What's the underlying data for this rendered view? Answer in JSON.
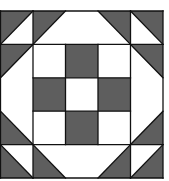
{
  "colors": {
    "dark": "#5e5e5e",
    "light": "#ffffff",
    "line": "#111111",
    "background": "#ffffff"
  },
  "block": {
    "x": 0.5,
    "y": 11,
    "width": 162.5,
    "height": 167,
    "grid": 5
  },
  "dark_squares": [
    {
      "col": 2,
      "row": 1
    },
    {
      "col": 1,
      "row": 2
    },
    {
      "col": 3,
      "row": 2
    },
    {
      "col": 2,
      "row": 3
    }
  ],
  "light_squares": [
    {
      "col": 1,
      "row": 1
    },
    {
      "col": 3,
      "row": 1
    },
    {
      "col": 2,
      "row": 2
    },
    {
      "col": 1,
      "row": 3
    },
    {
      "col": 3,
      "row": 3
    }
  ],
  "dark_triangles": [
    {
      "name": "top-left-corner",
      "pts": [
        [
          0,
          0
        ],
        [
          1,
          0
        ],
        [
          0,
          1
        ]
      ]
    },
    {
      "name": "top-left-inner",
      "pts": [
        [
          1,
          0
        ],
        [
          2,
          0
        ],
        [
          1,
          1
        ]
      ]
    },
    {
      "name": "top-right-inner",
      "pts": [
        [
          3,
          0
        ],
        [
          4,
          0
        ],
        [
          4,
          1
        ]
      ]
    },
    {
      "name": "top-right-corner",
      "pts": [
        [
          4,
          0
        ],
        [
          5,
          0
        ],
        [
          5,
          1
        ]
      ]
    },
    {
      "name": "left-upper",
      "pts": [
        [
          0,
          1
        ],
        [
          1,
          1
        ],
        [
          0,
          2
        ]
      ]
    },
    {
      "name": "right-upper",
      "pts": [
        [
          4,
          1
        ],
        [
          5,
          1
        ],
        [
          5,
          2
        ]
      ]
    },
    {
      "name": "left-lower",
      "pts": [
        [
          0,
          3
        ],
        [
          0,
          4
        ],
        [
          1,
          4
        ]
      ]
    },
    {
      "name": "right-lower",
      "pts": [
        [
          5,
          3
        ],
        [
          5,
          4
        ],
        [
          4,
          4
        ]
      ]
    },
    {
      "name": "bottom-left-corner",
      "pts": [
        [
          0,
          4
        ],
        [
          0,
          5
        ],
        [
          1,
          5
        ]
      ]
    },
    {
      "name": "bottom-left-inner",
      "pts": [
        [
          1,
          4
        ],
        [
          1,
          5
        ],
        [
          2,
          5
        ]
      ]
    },
    {
      "name": "bottom-right-inner",
      "pts": [
        [
          4,
          4
        ],
        [
          4,
          5
        ],
        [
          3,
          5
        ]
      ]
    },
    {
      "name": "bottom-right-corner",
      "pts": [
        [
          5,
          4
        ],
        [
          5,
          5
        ],
        [
          4,
          5
        ]
      ]
    }
  ],
  "lines": [
    [
      [
        0,
        0
      ],
      [
        5,
        0
      ]
    ],
    [
      [
        0,
        5
      ],
      [
        5,
        5
      ]
    ],
    [
      [
        0,
        0
      ],
      [
        0,
        5
      ]
    ],
    [
      [
        5,
        0
      ],
      [
        5,
        5
      ]
    ],
    [
      [
        1,
        0
      ],
      [
        1,
        5
      ]
    ],
    [
      [
        4,
        0
      ],
      [
        4,
        5
      ]
    ],
    [
      [
        0,
        1
      ],
      [
        5,
        1
      ]
    ],
    [
      [
        0,
        4
      ],
      [
        5,
        4
      ]
    ],
    [
      [
        2,
        1
      ],
      [
        2,
        4
      ]
    ],
    [
      [
        3,
        1
      ],
      [
        3,
        4
      ]
    ],
    [
      [
        1,
        2
      ],
      [
        4,
        2
      ]
    ],
    [
      [
        1,
        3
      ],
      [
        4,
        3
      ]
    ],
    [
      [
        0,
        1
      ],
      [
        1,
        0
      ]
    ],
    [
      [
        1,
        1
      ],
      [
        2,
        0
      ]
    ],
    [
      [
        3,
        0
      ],
      [
        4,
        1
      ]
    ],
    [
      [
        4,
        0
      ],
      [
        5,
        1
      ]
    ],
    [
      [
        0,
        2
      ],
      [
        1,
        1
      ]
    ],
    [
      [
        4,
        1
      ],
      [
        5,
        2
      ]
    ],
    [
      [
        0,
        3
      ],
      [
        1,
        4
      ]
    ],
    [
      [
        5,
        3
      ],
      [
        4,
        4
      ]
    ],
    [
      [
        0,
        4
      ],
      [
        1,
        5
      ]
    ],
    [
      [
        1,
        4
      ],
      [
        2,
        5
      ]
    ],
    [
      [
        4,
        4
      ],
      [
        3,
        5
      ]
    ],
    [
      [
        5,
        4
      ],
      [
        4,
        5
      ]
    ]
  ]
}
